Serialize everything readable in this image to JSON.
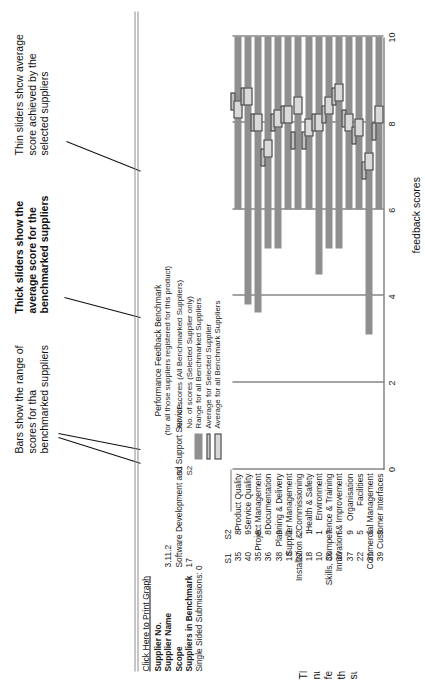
{
  "annotations": {
    "left_col_note": "This column displays the number of performance feedbacks completed by the benchmarked suppliers",
    "benchmark_col_note": "This column displays the number of suppliers in the benchmark",
    "bars_note": "Bars show the range of scores for tha benchmarked suppliers",
    "thick_note": "Thick sliders show the average score for the benchmarked suppliers",
    "thin_note": "Thin sliders shcw average score achieved by the selected suppliers",
    "bottom_note": "This column displays number of agreed feedback scores"
  },
  "header": {
    "print_link": "Click Here to Print Graph",
    "meta": [
      {
        "key": "Supplier No.",
        "value": "",
        "bold": true
      },
      {
        "key": "Supplier Name",
        "value": "3.11.2",
        "bold": true
      },
      {
        "key": "Scope",
        "value": "Software Development and Support Service...",
        "bold": true
      },
      {
        "key": "Suppliers in Benchmark",
        "value": "17",
        "bold": true
      },
      {
        "key": "Single Sided Submissions: 0",
        "value": "",
        "bold": false
      }
    ],
    "benchmark_title_line1": "Performance Feedback Benchmark",
    "benchmark_title_line2": "(for all those suppliers registered for this product)"
  },
  "legend": [
    {
      "key": "S1",
      "label": "No. of scores (All Benchmarked Suppliers)",
      "swatch": "s1-swatch"
    },
    {
      "key": "S2",
      "label": "No. of scores (Selected Supplier only)",
      "swatch": "s2-swatch"
    },
    {
      "key": "",
      "label": "Range for all Benchmarked Suppliers",
      "swatch": "range-bar-swatch"
    },
    {
      "key": "",
      "label": "Average for Selected Supplier",
      "swatch": "avg-selected-swatch"
    },
    {
      "key": "",
      "label": "Average for all Benchmark Suppliers",
      "swatch": "avg-all-swatch"
    }
  ],
  "columns": {
    "s1_header": "S1",
    "s2_header": "S2"
  },
  "chart_data": {
    "type": "bar",
    "title": "Performance Feedback Benchmark",
    "xlabel": "",
    "ylabel": "",
    "xlim": [
      0,
      10
    ],
    "ticks": [
      0,
      2,
      4,
      6,
      8,
      10
    ],
    "grid": true,
    "orientation": "horizontal",
    "categories": [
      "Product Quality",
      "Service Quality",
      "Project Management",
      "Documentation",
      "Planning & Delivery",
      "Supplier Management",
      "Installation & Commissioning",
      "Health & Safety",
      "Environment",
      "Skills, Competence & Training",
      "Innovation & Improvement",
      "Organisation",
      "Facilities",
      "Commercial Management",
      "Customer Interfaces"
    ],
    "s1": [
      35,
      40,
      35,
      36,
      38,
      18,
      27,
      18,
      10,
      36,
      30,
      37,
      22,
      31,
      39
    ],
    "s2": [
      8,
      9,
      8,
      8,
      9,
      2,
      2,
      1,
      1,
      7,
      6,
      9,
      5,
      6,
      9
    ],
    "range_low": [
      6.0,
      3.8,
      3.6,
      5.1,
      5.1,
      6.0,
      6.0,
      6.0,
      4.5,
      5.1,
      5.1,
      6.0,
      6.0,
      3.1,
      6.0
    ],
    "range_high": [
      10.0,
      10.0,
      10.0,
      10.0,
      10.0,
      10.0,
      10.0,
      10.0,
      10.0,
      10.0,
      10.0,
      10.0,
      10.0,
      10.0,
      10.0
    ],
    "avg_all": [
      8.3,
      8.6,
      8.0,
      7.4,
      8.1,
      8.2,
      8.4,
      7.9,
      8.0,
      8.4,
      8.7,
      8.0,
      7.9,
      7.1,
      8.2
    ],
    "avg_selected": [
      8.5,
      8.6,
      8.0,
      7.2,
      8.0,
      8.2,
      7.6,
      7.6,
      8.0,
      8.2,
      8.6,
      8.1,
      7.7,
      6.9,
      7.8
    ],
    "series": [
      {
        "name": "Range for all Benchmarked Suppliers",
        "type": "range"
      },
      {
        "name": "Average for all Benchmark Suppliers",
        "type": "thick-slider"
      },
      {
        "name": "Average for Selected Supplier",
        "type": "thin-slider"
      }
    ]
  }
}
